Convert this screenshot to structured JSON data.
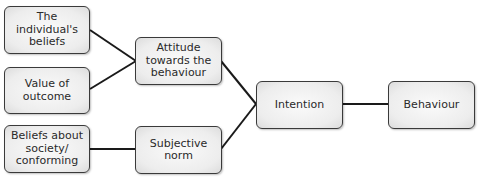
{
  "diagram": {
    "nodes": [
      {
        "id": "individual-beliefs",
        "label": "The individual's\nbeliefs"
      },
      {
        "id": "value-of-outcome",
        "label": "Value of\noutcome"
      },
      {
        "id": "beliefs-about-society",
        "label": "Beliefs about\nsociety/\nconforming"
      },
      {
        "id": "attitude",
        "label": "Attitude\ntowards the\nbehaviour"
      },
      {
        "id": "subjective-norm",
        "label": "Subjective\nnorm"
      },
      {
        "id": "intention",
        "label": "Intention"
      },
      {
        "id": "behaviour",
        "label": "Behaviour"
      }
    ],
    "edges": [
      {
        "from": "individual-beliefs",
        "to": "attitude"
      },
      {
        "from": "value-of-outcome",
        "to": "attitude"
      },
      {
        "from": "beliefs-about-society",
        "to": "subjective-norm"
      },
      {
        "from": "attitude",
        "to": "intention"
      },
      {
        "from": "subjective-norm",
        "to": "intention"
      },
      {
        "from": "intention",
        "to": "behaviour"
      }
    ],
    "colors": {
      "line": "#1a1a1a",
      "box_border": "#3a3a3a",
      "box_fill": "#ededed",
      "text": "#2a2a2a"
    }
  }
}
